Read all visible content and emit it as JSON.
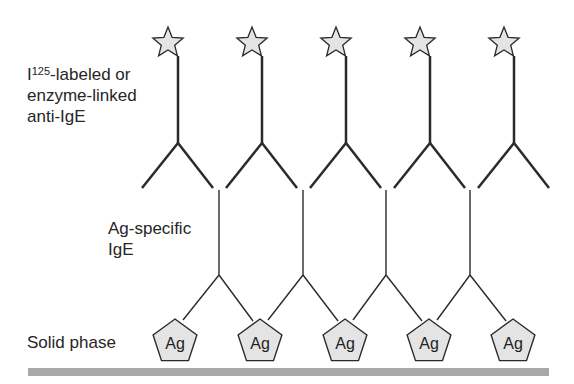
{
  "labels": {
    "anti_ige_prefix": "I",
    "anti_ige_superscript": "125",
    "anti_ige_line1_rest": "-labeled or",
    "anti_ige_line2": "enzyme-linked",
    "anti_ige_line3": "anti-IgE",
    "ige_line1": "Ag-specific",
    "ige_line2": "IgE",
    "solid_phase": "Solid phase"
  },
  "antigen_label": "Ag",
  "colors": {
    "line": "#2a2a2a",
    "star_fill": "#e4e4e4",
    "pentagon_fill": "#e4e4e4",
    "solid_phase_bar": "#a8a8a8"
  },
  "anti_ige_antibodies": [
    {
      "x": 178,
      "star_x": 168
    },
    {
      "x": 262,
      "star_x": 252
    },
    {
      "x": 346,
      "star_x": 336
    },
    {
      "x": 430,
      "star_x": 420
    },
    {
      "x": 514,
      "star_x": 504
    }
  ],
  "ige_antibodies": [
    {
      "x": 219
    },
    {
      "x": 303
    },
    {
      "x": 386
    },
    {
      "x": 470
    }
  ],
  "antigens": [
    {
      "x": 175
    },
    {
      "x": 260
    },
    {
      "x": 345
    },
    {
      "x": 429
    },
    {
      "x": 513
    }
  ]
}
